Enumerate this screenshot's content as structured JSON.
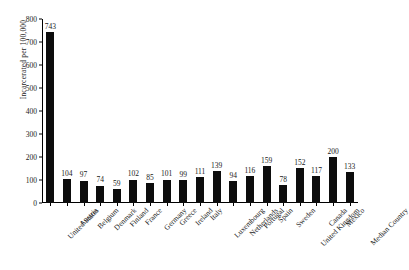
{
  "chart_data": {
    "type": "bar",
    "title": "",
    "xlabel": "",
    "ylabel": "Incarcerated per 100,000",
    "ylim": [
      0,
      800
    ],
    "ytick_step": 100,
    "yticks": [
      "0",
      "100",
      "200",
      "300",
      "400",
      "500",
      "600",
      "700",
      "800"
    ],
    "grid": false,
    "legend": "none",
    "bar_color": "#0d0d0d",
    "show_value_labels": true,
    "categories": [
      "United States",
      "Austria",
      "Belgium",
      "Denmark",
      "Finland",
      "France",
      "Germany",
      "Greece",
      "Ireland",
      "Italy",
      "Luxembourg",
      "Netherlands",
      "Portugal",
      "Spain",
      "Sweden",
      "United Kingdom",
      "Canada",
      "Mexico",
      "Median Country"
    ],
    "values": [
      743,
      104,
      97,
      74,
      59,
      102,
      85,
      101,
      99,
      111,
      139,
      94,
      116,
      159,
      78,
      152,
      117,
      200,
      133
    ]
  }
}
